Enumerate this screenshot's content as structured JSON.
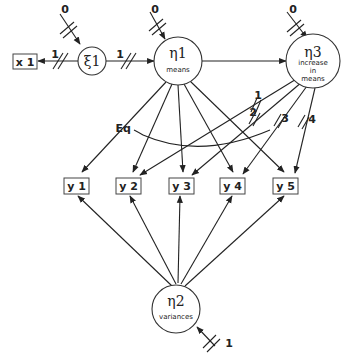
{
  "diagram": {
    "type": "path-diagram",
    "observed": {
      "x1": "x 1",
      "y1": "y 1",
      "y2": "y 2",
      "y3": "y 3",
      "y4": "y 4",
      "y5": "y 5"
    },
    "latent": {
      "xi1": {
        "symbol": "ξ1",
        "caption": ""
      },
      "eta1": {
        "symbol": "η1",
        "caption": "means"
      },
      "eta2": {
        "symbol": "η2",
        "caption": "variances"
      },
      "eta3": {
        "symbol": "η3",
        "caption_lines": [
          "increase",
          "in",
          "means"
        ]
      }
    },
    "fixed_params": {
      "xi1_mean": "0",
      "eta1_mean": "0",
      "eta3_mean": "0",
      "eta2_var": "1",
      "xi1_to_x1": "1",
      "xi1_to_eta1": "1",
      "eta3_y2": "1",
      "eta3_y3": "2",
      "eta3_y4": "3",
      "eta3_y5": "4"
    },
    "equality_label": "Eq"
  }
}
